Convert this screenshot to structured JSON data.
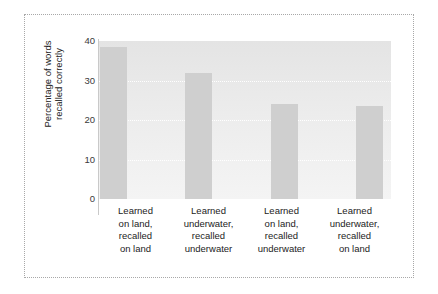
{
  "chart_data": {
    "type": "bar",
    "title": "",
    "subtitle": "",
    "xlabel": "",
    "ylabel": "Percentage of words recalled correctly",
    "ylabel_lines": [
      "Percentage of words",
      "recalled correctly"
    ],
    "ylim": [
      0,
      40
    ],
    "ytick_values": [
      0,
      10,
      20,
      30,
      40
    ],
    "ytick_labels": [
      "0",
      "10",
      "20",
      "30",
      "40"
    ],
    "grid": true,
    "grid_axis": "y",
    "gridline_values": [
      10,
      20,
      30
    ],
    "legend": null,
    "legend_position": "none",
    "categories": [
      "Learned on land, recalled on land",
      "Learned underwater, recalled underwater",
      "Learned on land, recalled underwater",
      "Learned underwater, recalled on land"
    ],
    "category_lines": [
      [
        "Learned",
        "on land,",
        "recalled",
        "on land"
      ],
      [
        "Learned",
        "underwater,",
        "recalled",
        "underwater"
      ],
      [
        "Learned",
        "on land,",
        "recalled",
        "underwater"
      ],
      [
        "Learned",
        "underwater,",
        "recalled",
        "on land"
      ]
    ],
    "values": [
      38.5,
      32,
      24,
      23.5
    ],
    "bar_color": "#cfcfcf",
    "plot_background_color": "#ececec",
    "gridline_color": "#ffffff",
    "axis_color": "#c9c9c9",
    "text_color": "#232323",
    "border_color": "#a8a8a8"
  }
}
